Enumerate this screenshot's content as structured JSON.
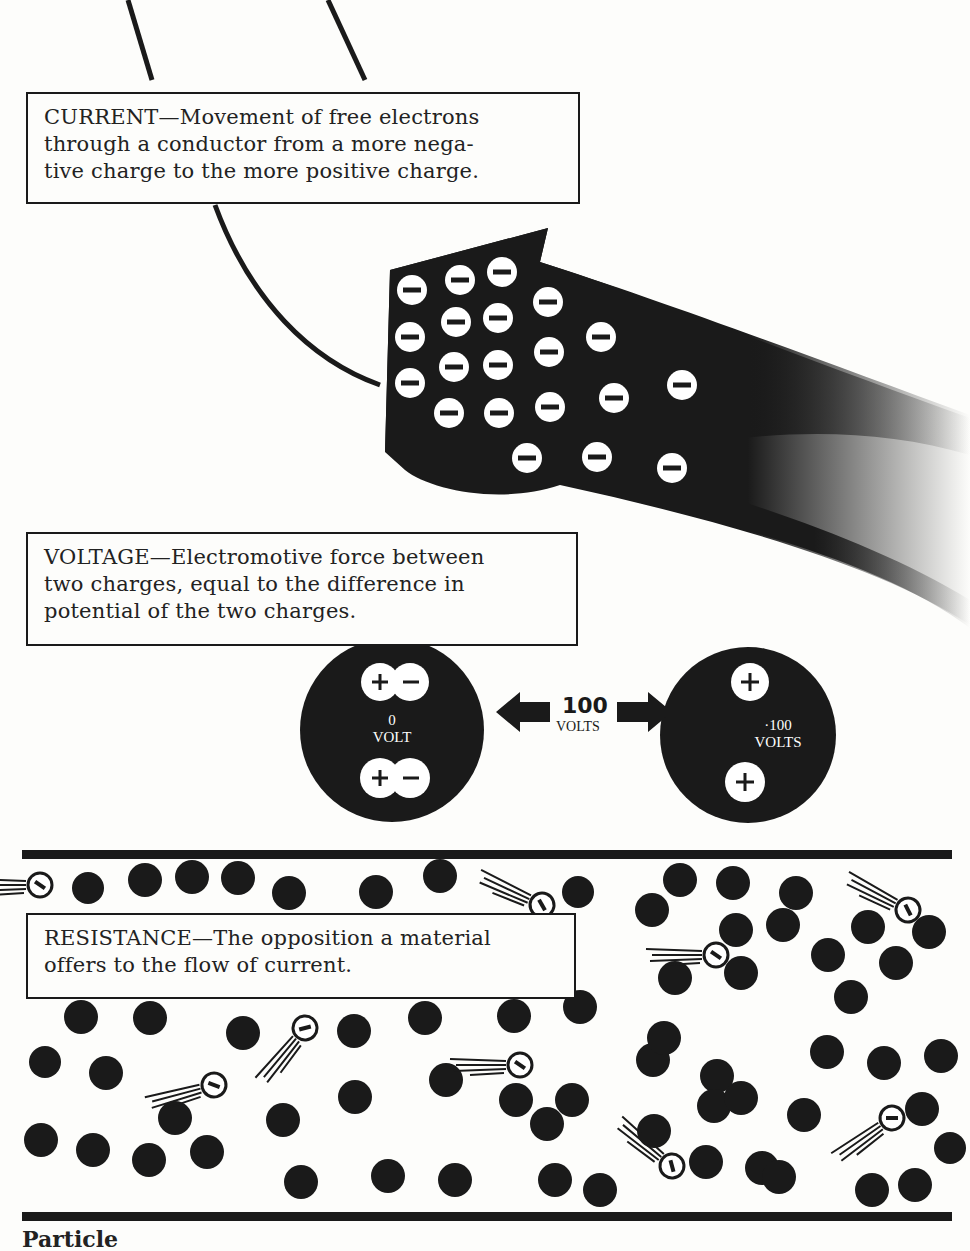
{
  "current": {
    "term": "CURRENT",
    "dash": "—",
    "line1": "Movement of free electrons",
    "line2": "through a conductor from a more nega-",
    "line3": "tive charge to the more positive charge."
  },
  "voltage": {
    "term": "VOLTAGE",
    "dash": "—",
    "line1": "Electromotive force between",
    "line2": "two charges, equal to the difference in",
    "line3": "potential of the two charges.",
    "left_sphere": {
      "value": "0",
      "unit": "VOLT",
      "charges": [
        "+−",
        "+−"
      ]
    },
    "right_sphere": {
      "value": "·100",
      "unit": "VOLTS",
      "charges": [
        "+",
        "+"
      ]
    },
    "difference": {
      "value": "100",
      "unit": "VOLTS"
    }
  },
  "resistance": {
    "term": "RESISTANCE",
    "dash": "—",
    "line1": "The opposition a material",
    "line2": "offers to the flow of current."
  },
  "footer": {
    "caption_fragment": "Particle"
  },
  "icons": {
    "electron": "minus-in-circle",
    "positive": "plus-in-circle",
    "atom": "filled-circle"
  },
  "colors": {
    "ink": "#1a1a1a",
    "paper": "#fdfdfb"
  }
}
